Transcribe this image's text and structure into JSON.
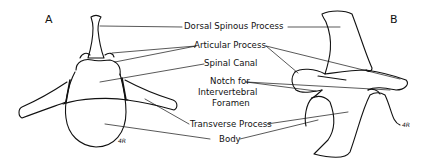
{
  "figure": {
    "panel_a_letter": "A",
    "panel_b_letter": "B",
    "signature": "4R",
    "labels": {
      "dorsal_spinous_process": "Dorsal Spinous Process",
      "articular_process": "Articular Process",
      "spinal_canal": "Spinal Canal",
      "notch_line1": "Notch for",
      "notch_line2": "Intervertebral",
      "notch_line3": "Foramen",
      "transverse_process": "Transverse Process",
      "body": "Body"
    },
    "colors": {
      "ink": "#111111",
      "background": "#ffffff"
    }
  }
}
